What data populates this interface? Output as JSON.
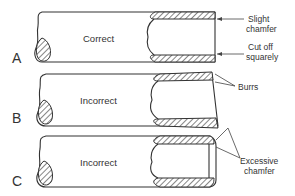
{
  "diagram": {
    "panels": [
      {
        "id": "A",
        "letter": "A",
        "label": "Correct",
        "callouts": [
          {
            "line1": "Slight",
            "line2": "chamfer"
          },
          {
            "line1": "Cut off",
            "line2": "squarely"
          }
        ]
      },
      {
        "id": "B",
        "letter": "B",
        "label": "Incorrect",
        "callouts": [
          {
            "line1": "Burrs",
            "line2": ""
          }
        ]
      },
      {
        "id": "C",
        "letter": "C",
        "label": "Incorrect",
        "callouts": [
          {
            "line1": "Excessive",
            "line2": "chamfer"
          }
        ]
      }
    ],
    "colors": {
      "line": "#333333",
      "background": "#ffffff",
      "hatch": "#444444"
    }
  }
}
